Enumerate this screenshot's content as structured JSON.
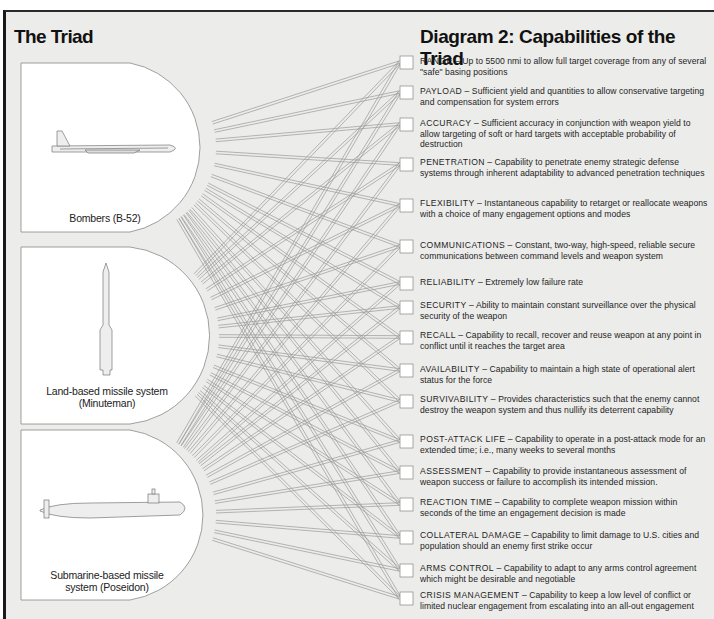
{
  "left_title": "The Triad",
  "right_title": "Diagram 2: Capabilities of the Triad",
  "systems": [
    {
      "id": "bombers",
      "label": "Bombers (B-52)",
      "icon": "b52-bomber-icon"
    },
    {
      "id": "land",
      "label_line1": "Land-based missile system",
      "label_line2": "(Minuteman)",
      "icon": "minuteman-missile-icon"
    },
    {
      "id": "sub",
      "label_line1": "Submarine-based missile",
      "label_line2": "system (Poseidon)",
      "icon": "poseidon-submarine-icon"
    }
  ],
  "capabilities": [
    {
      "name": "RANGE",
      "desc": "Up to 5500 nmi to allow full target coverage from any of several \"safe\" basing positions"
    },
    {
      "name": "PAYLOAD",
      "desc": "Sufficient yield and quantities to allow conservative targeting and compensation for system errors"
    },
    {
      "name": "ACCURACY",
      "desc": "Sufficient accuracy in conjunction with weapon yield to allow targeting of soft or hard targets with acceptable probability of destruction"
    },
    {
      "name": "PENETRATION",
      "desc": "Capability to penetrate enemy strategic defense systems through inherent adaptability to advanced penetration techniques"
    },
    {
      "name": "FLEXIBILITY",
      "desc": "Instantaneous capability to retarget or reallocate weapons with a choice of many engagement options and modes"
    },
    {
      "name": "COMMUNICATIONS",
      "desc": "Constant, two-way, high-speed, reliable secure communications between command levels and weapon system"
    },
    {
      "name": "RELIABILITY",
      "desc": "Extremely low failure rate"
    },
    {
      "name": "SECURITY",
      "desc": "Ability to maintain constant surveillance over the physical security of the weapon"
    },
    {
      "name": "RECALL",
      "desc": "Capability to recall, recover and reuse weapon at any point in conflict until it reaches the target area"
    },
    {
      "name": "AVAILABILITY",
      "desc": "Capability to maintain a high state of operational alert status for the force"
    },
    {
      "name": "SURVIVABILITY",
      "desc": "Provides characteristics such that the enemy cannot destroy the weapon system and thus nullify its deterrent capability"
    },
    {
      "name": "POST-ATTACK LIFE",
      "desc": "Capability to operate in a post-attack mode for an extended time; i.e., many weeks to several months"
    },
    {
      "name": "ASSESSMENT",
      "desc": "Capability to provide instantaneous assessment of weapon success or failure to accomplish its intended mission."
    },
    {
      "name": "REACTION TIME",
      "desc": "Capability to complete weapon mission within seconds of the time an engagement decision is made"
    },
    {
      "name": "COLLATERAL DAMAGE",
      "desc": "Capability to limit damage to U.S. cities and population should an enemy first strike occur"
    },
    {
      "name": "ARMS CONTROL",
      "desc": "Capability to adapt to any arms control agreement which might be desirable and negotiable"
    },
    {
      "name": "CRISIS MANAGEMENT",
      "desc": "Capability to keep a low level of conflict or limited nuclear engagement from escalating into an all-out engagement"
    }
  ],
  "dash": " – ",
  "colors": {
    "background": "#ececea",
    "panel": "#ffffff",
    "line": "#9a9a9a",
    "text": "#1e1e1e"
  }
}
